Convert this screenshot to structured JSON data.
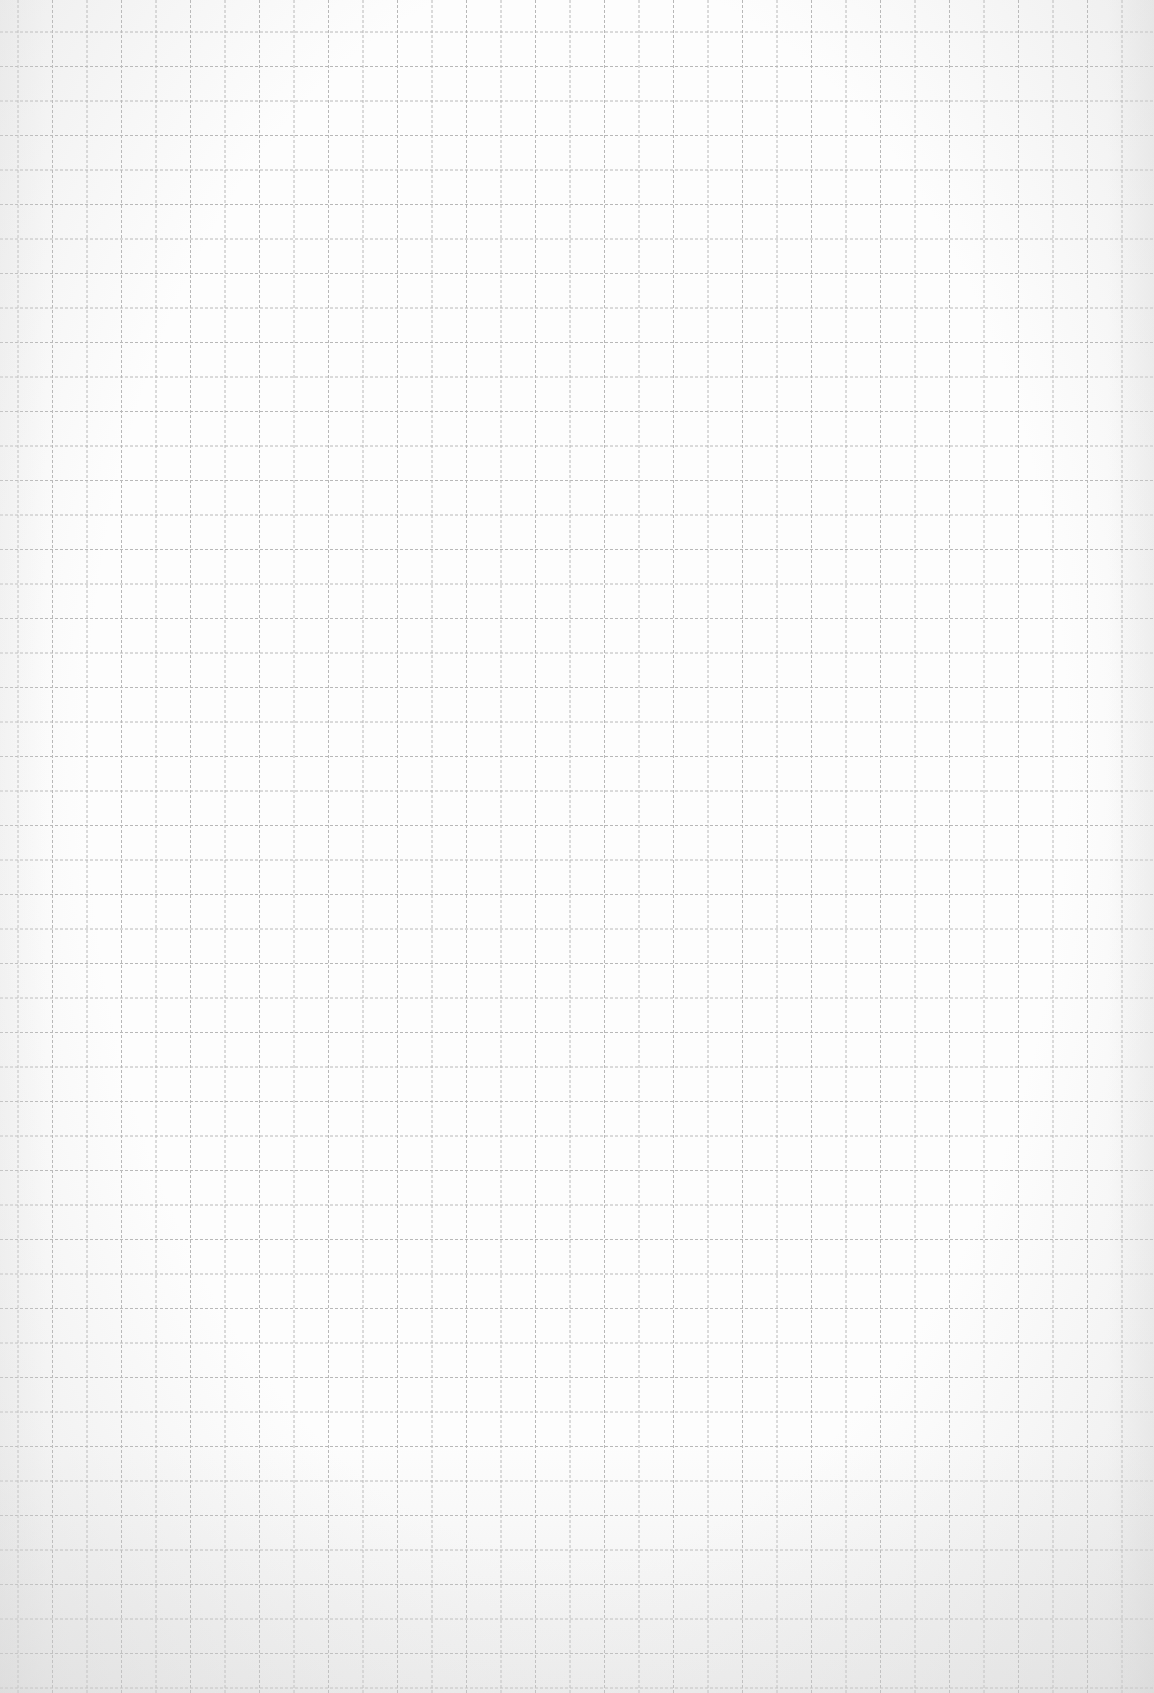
{
  "paper": {
    "type": "graph-paper",
    "background_color": "#fdfdfd",
    "line_color": "#b8b8b8",
    "line_style": "dashed",
    "cell_size_px": 34.5,
    "vertical_offset_px": 18,
    "horizontal_offset_px": 32,
    "width": 1154,
    "height": 1693
  }
}
